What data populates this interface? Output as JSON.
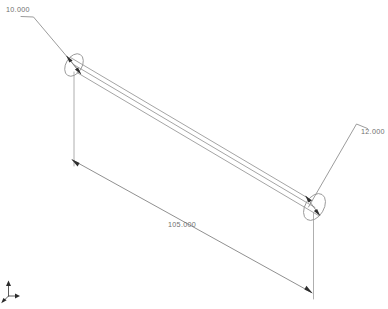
{
  "viewport": {
    "width": 388,
    "height": 309,
    "background_color": "#ffffff",
    "line_color": "#949494",
    "text_color": "#6f6f6f",
    "arrow_color": "#2e2e2e"
  },
  "model": {
    "part_type": "cylindrical-rod",
    "projection": "isometric",
    "description": "Long cylindrical rod shown in isometric view with diameter dimensions at both ends and an overall length dimension."
  },
  "dimensions": [
    {
      "id": "diameter-left",
      "label": "10.000",
      "kind": "diameter",
      "attached_to": "left-end-face",
      "text_x": 6,
      "text_y": 12
    },
    {
      "id": "diameter-right",
      "label": "12.000",
      "kind": "diameter",
      "attached_to": "right-end-face",
      "text_x": 361,
      "text_y": 134
    },
    {
      "id": "length-overall",
      "label": "105.000",
      "kind": "linear",
      "attached_to": "rod-axis",
      "text_x": 168,
      "text_y": 227
    }
  ],
  "axis_triad": {
    "label": "origin-triad",
    "x": 6,
    "y": 284
  }
}
